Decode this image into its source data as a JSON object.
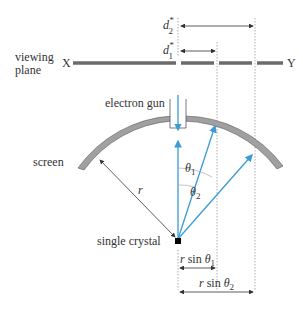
{
  "labels": {
    "viewing_plane_line1": "viewing",
    "viewing_plane_line2": "plane",
    "x_end": "X",
    "y_end": "Y",
    "electron_gun": "electron gun",
    "screen": "screen",
    "radius": "r",
    "crystal": "single crystal",
    "theta1": "θ",
    "theta1_sub": "1",
    "theta2": "θ",
    "theta2_sub": "2",
    "d1": "d",
    "d1_sup": "*",
    "d1_sub": "1",
    "d2": "d",
    "d2_sup": "*",
    "d2_sub": "2",
    "rsin1_r": "r",
    "rsin1_sin": " sin ",
    "rsin1_theta": "θ",
    "rsin1_sub": "1",
    "rsin2_r": "r",
    "rsin2_sin": " sin ",
    "rsin2_theta": "θ",
    "rsin2_sub": "2"
  },
  "colors": {
    "beam": "#3a9bd5",
    "screen_fill": "#a0a0a0",
    "plane_line": "#6b6b6b",
    "text": "#333333"
  }
}
